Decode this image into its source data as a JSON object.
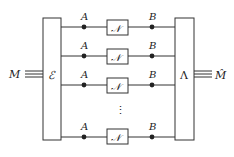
{
  "diagram": {
    "type": "quantum-channel-parallel-uses",
    "input_label": "M",
    "output_label": "M̂",
    "encoder": {
      "label": "ℰ"
    },
    "decoder": {
      "label": "Λ"
    },
    "channels": [
      {
        "input_label": "A",
        "box_label": "𝒩",
        "output_label": "B"
      },
      {
        "input_label": "A",
        "box_label": "𝒩",
        "output_label": "B"
      },
      {
        "input_label": "A",
        "box_label": "𝒩",
        "output_label": "B"
      },
      {
        "input_label": "A",
        "box_label": "𝒩",
        "output_label": "B"
      }
    ],
    "ellipsis": "⋮",
    "colors": {
      "stroke": "#333333",
      "dot": "#222222",
      "background": "#ffffff"
    }
  }
}
